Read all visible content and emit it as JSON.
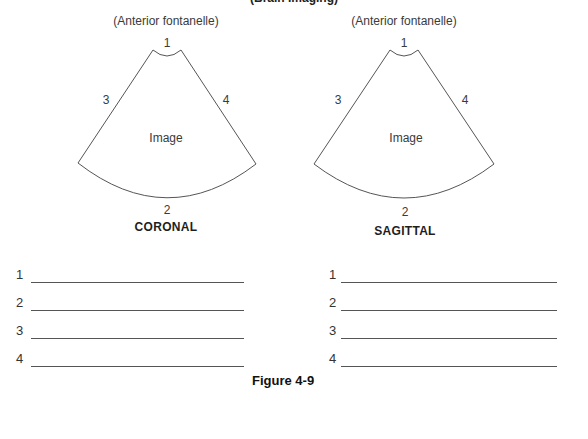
{
  "header": {
    "title": "(Brain Imaging)"
  },
  "diagrams": [
    {
      "view_label": "CORONAL",
      "approach_label": "(Anterior fontanelle)",
      "image_label": "Image",
      "markers": {
        "top": "1",
        "bottom": "2",
        "left": "3",
        "right": "4"
      }
    },
    {
      "view_label": "SAGITTAL",
      "approach_label": "(Anterior fontanelle)",
      "image_label": "Image",
      "markers": {
        "top": "1",
        "bottom": "2",
        "left": "3",
        "right": "4"
      }
    }
  ],
  "answer_sets": [
    {
      "for_view": "CORONAL",
      "items": [
        {
          "number": "1",
          "value": ""
        },
        {
          "number": "2",
          "value": ""
        },
        {
          "number": "3",
          "value": ""
        },
        {
          "number": "4",
          "value": ""
        }
      ]
    },
    {
      "for_view": "SAGITTAL",
      "items": [
        {
          "number": "1",
          "value": ""
        },
        {
          "number": "2",
          "value": ""
        },
        {
          "number": "3",
          "value": ""
        },
        {
          "number": "4",
          "value": ""
        }
      ]
    }
  ],
  "figure_caption": "Figure 4-9"
}
